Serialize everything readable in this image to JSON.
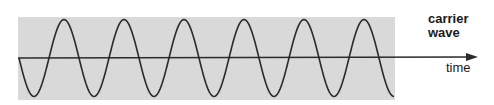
{
  "diagram": {
    "label_line1": "carrier",
    "label_line2": "wave",
    "axis_label": "time",
    "colors": {
      "background_band": "#d9d9d9",
      "wave": "#2a2a2a",
      "axis": "#2a2a2a"
    },
    "wave": {
      "cycles": 6.25,
      "period_px": 60
    }
  }
}
